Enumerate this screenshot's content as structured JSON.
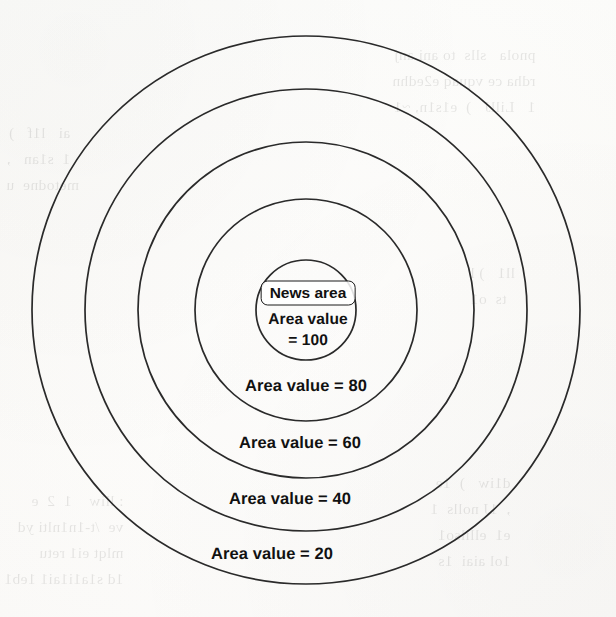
{
  "figure": {
    "type": "concentric-circles-diagram",
    "background_color": "#fdfcfa",
    "stroke_color": "#2a2a2a",
    "text_color": "#111111",
    "center": {
      "x": 306,
      "y": 310
    },
    "center_box": {
      "label": "News area",
      "x": 308,
      "y": 292,
      "width": 94,
      "height": 21
    },
    "center_lines": [
      {
        "text": "Area value",
        "x": 308,
        "y": 320
      },
      {
        "text": "= 100",
        "x": 308,
        "y": 341
      }
    ]
  },
  "chart_data": {
    "type": "pie",
    "xlabel": "",
    "ylabel": "",
    "legend_position": "inline",
    "grid": false,
    "categories": [
      "100",
      "80",
      "60",
      "40",
      "20"
    ],
    "values": [
      100,
      80,
      60,
      40,
      20
    ],
    "series": [
      {
        "name": "Area value",
        "values": [
          100,
          80,
          60,
          40,
          20
        ]
      }
    ],
    "rings": [
      {
        "name": "ring-100",
        "area_value": 100,
        "radius": 50,
        "label": "Area value = 100",
        "label_lines": [
          "Area value",
          "= 100"
        ],
        "label_x": 308,
        "label_y": 330,
        "has_box": true,
        "box_label": "News area"
      },
      {
        "name": "ring-80",
        "area_value": 80,
        "radius": 111,
        "label": "Area value = 80",
        "label_x": 306,
        "label_y": 386
      },
      {
        "name": "ring-60",
        "area_value": 60,
        "radius": 168,
        "label": "Area value = 60",
        "label_x": 300,
        "label_y": 443
      },
      {
        "name": "ring-40",
        "area_value": 40,
        "radius": 221,
        "label": "Area value = 40",
        "label_x": 290,
        "label_y": 499
      },
      {
        "name": "ring-20",
        "area_value": 20,
        "radius": 274,
        "label": "Area value = 20",
        "label_x": 272,
        "label_y": 554
      }
    ],
    "annotations": [
      "News area",
      "Area value = 100",
      "Area value = 80",
      "Area value = 60",
      "Area value = 40",
      "Area value = 20"
    ]
  },
  "labels": {
    "news_area": "News area",
    "area_value_text": "Area value",
    "value_100": "= 100",
    "value_80": "Area value = 80",
    "value_60": "Area value = 60",
    "value_40": "Area value = 40",
    "value_20": "Area value = 20"
  }
}
